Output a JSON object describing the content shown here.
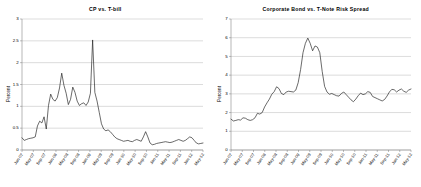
{
  "figure": {
    "background": "#ffffff",
    "line_color": "#1a1a1a",
    "grid_color": "#a6a6a6"
  },
  "chart_data": [
    {
      "type": "line",
      "title": "CP vs. T-bill",
      "xlabel": "",
      "ylabel": "Percent",
      "ylim": [
        0,
        3
      ],
      "yticks": [
        0,
        0.5,
        1,
        1.5,
        2,
        2.5,
        3
      ],
      "ytick_labels": [
        "0",
        "0.5",
        "1",
        "1.5",
        "2",
        "2.5",
        "3"
      ],
      "grid": true,
      "legend": "none",
      "xtick_labels": [
        "Jan-07",
        "May-07",
        "Sep-07",
        "Jan-08",
        "May-08",
        "Sep-08",
        "Jan-09",
        "May-09",
        "Sep-09",
        "Jan-10",
        "May-10",
        "Sep-10",
        "Jan-11",
        "May-11",
        "Sep-11",
        "Jan-12",
        "May-12"
      ],
      "x": [
        "Jan-07",
        "Feb-07",
        "Mar-07",
        "Apr-07",
        "May-07",
        "Jun-07",
        "Jul-07",
        "Aug-07",
        "Sep-07",
        "Oct-07",
        "Nov-07",
        "Dec-07",
        "Jan-08",
        "Feb-08",
        "Mar-08",
        "Apr-08",
        "May-08",
        "Jun-08",
        "Jul-08",
        "Aug-08",
        "Sep-08",
        "Oct-08",
        "Nov-08",
        "Dec-08",
        "Jan-09",
        "Feb-09",
        "Mar-09",
        "Apr-09",
        "May-09",
        "Jun-09",
        "Jul-09",
        "Aug-09",
        "Sep-09",
        "Oct-09",
        "Nov-09",
        "Dec-09",
        "Jan-10",
        "Feb-10",
        "Mar-10",
        "Apr-10",
        "May-10",
        "Jun-10",
        "Jul-10",
        "Aug-10",
        "Sep-10",
        "Oct-10",
        "Nov-10",
        "Dec-10",
        "Jan-11",
        "Feb-11",
        "Mar-11",
        "Apr-11",
        "May-11",
        "Jun-11",
        "Jul-11",
        "Aug-11",
        "Sep-11",
        "Oct-11",
        "Nov-11",
        "Dec-11",
        "Jan-12",
        "Feb-12",
        "Mar-12",
        "Apr-12",
        "May-12"
      ],
      "values": [
        0.28,
        0.22,
        0.24,
        0.26,
        0.27,
        0.28,
        0.3,
        0.55,
        0.66,
        0.62,
        0.76,
        0.48,
        1.02,
        1.28,
        1.16,
        1.12,
        1.2,
        1.42,
        1.76,
        1.48,
        1.3,
        1.04,
        1.16,
        1.44,
        1.32,
        1.12,
        1.02,
        1.06,
        1.08,
        1.02,
        1.1,
        1.3,
        2.52,
        1.32,
        1.12,
        0.86,
        0.6,
        0.48,
        0.44,
        0.46,
        0.42,
        0.36,
        0.3,
        0.26,
        0.24,
        0.22,
        0.2,
        0.21,
        0.22,
        0.2,
        0.19,
        0.22,
        0.24,
        0.22,
        0.2,
        0.3,
        0.42,
        0.3,
        0.16,
        0.12,
        0.13,
        0.15,
        0.16,
        0.17,
        0.18,
        0.19,
        0.18,
        0.17,
        0.18,
        0.2,
        0.22,
        0.24,
        0.22,
        0.2,
        0.22,
        0.26,
        0.3,
        0.28,
        0.22,
        0.16,
        0.14,
        0.15,
        0.16
      ]
    },
    {
      "type": "line",
      "title": "Corporate Bond vs. T-Note Risk Spread",
      "xlabel": "",
      "ylabel": "Percent",
      "ylim": [
        0,
        7
      ],
      "yticks": [
        0,
        1,
        2,
        3,
        4,
        5,
        6,
        7
      ],
      "ytick_labels": [
        "0",
        "1",
        "2",
        "3",
        "4",
        "5",
        "6",
        "7"
      ],
      "grid": true,
      "legend": "none",
      "xtick_labels": [
        "Jan-07",
        "May-07",
        "Sep-07",
        "Jan-08",
        "May-08",
        "Sep-08",
        "Jan-09",
        "May-09",
        "Sep-09",
        "Jan-10",
        "May-10",
        "Sep-10",
        "Jan-11",
        "May-11",
        "Sep-11",
        "Jan-12",
        "May-12"
      ],
      "x": [
        "Jan-07",
        "Feb-07",
        "Mar-07",
        "Apr-07",
        "May-07",
        "Jun-07",
        "Jul-07",
        "Aug-07",
        "Sep-07",
        "Oct-07",
        "Nov-07",
        "Dec-07",
        "Jan-08",
        "Feb-08",
        "Mar-08",
        "Apr-08",
        "May-08",
        "Jun-08",
        "Jul-08",
        "Aug-08",
        "Sep-08",
        "Oct-08",
        "Nov-08",
        "Dec-08",
        "Jan-09",
        "Feb-09",
        "Mar-09",
        "Apr-09",
        "May-09",
        "Jun-09",
        "Jul-09",
        "Aug-09",
        "Sep-09",
        "Oct-09",
        "Nov-09",
        "Dec-09",
        "Jan-10",
        "Feb-10",
        "Mar-10",
        "Apr-10",
        "May-10",
        "Jun-10",
        "Jul-10",
        "Aug-10",
        "Sep-10",
        "Oct-10",
        "Nov-10",
        "Dec-10",
        "Jan-11",
        "Feb-11",
        "Mar-11",
        "Apr-11",
        "May-11",
        "Jun-11",
        "Jul-11",
        "Aug-11",
        "Sep-11",
        "Oct-11",
        "Nov-11",
        "Dec-11",
        "Jan-12",
        "Feb-12",
        "Mar-12",
        "Apr-12",
        "May-12"
      ],
      "values": [
        1.65,
        1.55,
        1.58,
        1.62,
        1.6,
        1.72,
        1.7,
        1.62,
        1.58,
        1.62,
        1.72,
        1.96,
        1.92,
        2.0,
        2.3,
        2.52,
        2.72,
        2.98,
        3.12,
        3.38,
        3.28,
        3.02,
        2.96,
        3.1,
        3.14,
        3.12,
        3.1,
        3.2,
        3.6,
        4.3,
        5.2,
        5.7,
        5.98,
        5.7,
        5.3,
        5.56,
        5.5,
        5.2,
        4.2,
        3.4,
        3.1,
        2.98,
        3.02,
        2.96,
        2.9,
        2.88,
        3.02,
        3.1,
        2.96,
        2.82,
        2.68,
        2.58,
        2.72,
        2.9,
        3.04,
        2.96,
        3.0,
        3.12,
        3.08,
        2.86,
        2.8,
        2.74,
        2.68,
        2.62,
        2.7,
        2.88,
        3.1,
        3.24,
        3.22,
        3.1,
        3.2,
        3.26,
        3.14,
        3.08,
        3.2,
        3.26
      ]
    }
  ]
}
